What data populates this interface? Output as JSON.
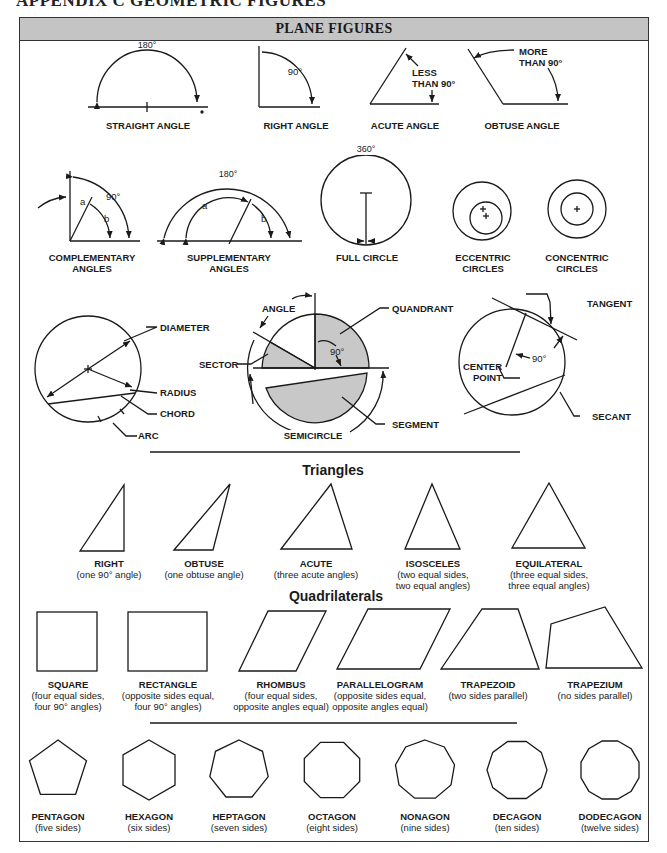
{
  "page": {
    "title": "APPENDIX C  GEOMETRIC FIGURES",
    "panel_title": "PLANE FIGURES"
  },
  "angles": {
    "straight": {
      "label": "STRAIGHT ANGLE",
      "measure": "180°"
    },
    "right": {
      "label": "RIGHT ANGLE",
      "measure": "90°"
    },
    "acute": {
      "label": "ACUTE ANGLE",
      "measure_line1": "LESS",
      "measure_line2": "THAN 90°"
    },
    "obtuse": {
      "label": "OBTUSE ANGLE",
      "measure_line1": "MORE",
      "measure_line2": "THAN 90°"
    },
    "complementary": {
      "label_line1": "COMPLEMENTARY",
      "label_line2": "ANGLES",
      "measure": "90°",
      "a": "a",
      "b": "b"
    },
    "supplementary": {
      "label_line1": "SUPPLEMENTARY",
      "label_line2": "ANGLES",
      "measure": "180°",
      "a": "a",
      "b": "b"
    }
  },
  "circles": {
    "full": {
      "label": "FULL CIRCLE",
      "measure": "360°"
    },
    "eccentric": {
      "label_line1": "ECCENTRIC",
      "label_line2": "CIRCLES"
    },
    "concentric": {
      "label_line1": "CONCENTRIC",
      "label_line2": "CIRCLES"
    },
    "parts_left": {
      "diameter": "DIAMETER",
      "radius": "RADIUS",
      "chord": "CHORD",
      "arc": "ARC"
    },
    "parts_middle": {
      "angle": "ANGLE",
      "quadrant": "QUANDRANT",
      "sector": "SECTOR",
      "measure": "90°",
      "segment": "SEGMENT",
      "semicircle": "SEMICIRCLE"
    },
    "parts_right": {
      "tangent": "TANGENT",
      "measure": "90°",
      "center_line1": "CENTER",
      "center_line2": "POINT",
      "secant": "SECANT"
    }
  },
  "triangles": {
    "heading": "Triangles",
    "items": [
      {
        "name": "RIGHT",
        "desc1": "(one 90° angle)",
        "desc2": ""
      },
      {
        "name": "OBTUSE",
        "desc1": "(one obtuse angle)",
        "desc2": ""
      },
      {
        "name": "ACUTE",
        "desc1": "(three acute angles)",
        "desc2": ""
      },
      {
        "name": "ISOSCELES",
        "desc1": "(two equal sides,",
        "desc2": "two equal angles)"
      },
      {
        "name": "EQUILATERAL",
        "desc1": "(three equal sides,",
        "desc2": "three equal angles)"
      }
    ]
  },
  "quadrilaterals": {
    "heading": "Quadrilaterals",
    "items": [
      {
        "name": "SQUARE",
        "desc1": "(four equal sides,",
        "desc2": "four 90° angles)"
      },
      {
        "name": "RECTANGLE",
        "desc1": "(opposite sides equal,",
        "desc2": "four 90° angles)"
      },
      {
        "name": "RHOMBUS",
        "desc1": "(four equal sides,",
        "desc2": "opposite angles equal)"
      },
      {
        "name": "PARALLELOGRAM",
        "desc1": "(opposite sides equal,",
        "desc2": "opposite angles equal)"
      },
      {
        "name": "TRAPEZOID",
        "desc1": "(two sides parallel)",
        "desc2": ""
      },
      {
        "name": "TRAPEZIUM",
        "desc1": "(no sides parallel)",
        "desc2": ""
      }
    ]
  },
  "polygons": {
    "items": [
      {
        "name": "PENTAGON",
        "desc": "(five sides)",
        "sides": 5
      },
      {
        "name": "HEXAGON",
        "desc": "(six sides)",
        "sides": 6
      },
      {
        "name": "HEPTAGON",
        "desc": "(seven sides)",
        "sides": 7
      },
      {
        "name": "OCTAGON",
        "desc": "(eight sides)",
        "sides": 8
      },
      {
        "name": "NONAGON",
        "desc": "(nine sides)",
        "sides": 9
      },
      {
        "name": "DECAGON",
        "desc": "(ten sides)",
        "sides": 10
      },
      {
        "name": "DODECAGON",
        "desc": "(twelve sides)",
        "sides": 12
      }
    ]
  },
  "colors": {
    "header_bg": "#c4c4c4",
    "fill_gray": "#c8c8c8",
    "line": "#1a1a1a"
  }
}
